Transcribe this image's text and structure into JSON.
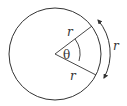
{
  "diagram": {
    "labels": {
      "radius_upper": "r",
      "radius_lower": "r",
      "arc": "r",
      "angle": "θ"
    },
    "colors": {
      "stroke": "#333333",
      "background": "#ffffff"
    }
  }
}
